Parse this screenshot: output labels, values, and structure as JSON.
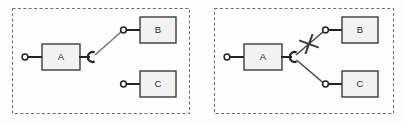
{
  "canvas": {
    "width": 404,
    "height": 124,
    "background": "#fdfdfd"
  },
  "palette": {
    "box_fill": "#f2f2f2",
    "box_stroke": "#3b3b3b",
    "panel_stroke": "#6b6b6b",
    "connector_stroke": "#242424",
    "link_stroke": "#777777",
    "cross_stroke": "#3a3a3a",
    "label_color": "#2b2b2b"
  },
  "diagram": {
    "type": "component-assembly-diagram",
    "notation": "UML ball-and-socket (lollipop) connectors",
    "panels": [
      {
        "id": "panel-left",
        "name": "left-panel",
        "border_style": "dashed",
        "rect": {
          "x": 12,
          "y": 8,
          "w": 178,
          "h": 106
        },
        "components": [
          {
            "id": "left-a",
            "label": "A",
            "rect": {
              "x": 42,
              "y": 44,
              "w": 38,
              "h": 26
            },
            "provided_interface": {
              "kind": "lollipop-ball",
              "side": "left",
              "stem": {
                "x1": 27,
                "y1": 57,
                "x2": 42,
                "y2": 57
              },
              "ball": {
                "cx": 25,
                "cy": 57,
                "r": 3
              }
            },
            "required_interface": {
              "kind": "socket-arc",
              "side": "right",
              "stem": {
                "x1": 80,
                "y1": 57,
                "x2": 90,
                "y2": 57
              },
              "arc": {
                "cx": 93,
                "cy": 57,
                "r": 5,
                "opening_deg": 40
              }
            }
          },
          {
            "id": "left-b",
            "label": "B",
            "rect": {
              "x": 140,
              "y": 17,
              "w": 36,
              "h": 26
            },
            "provided_interface": {
              "kind": "lollipop-ball",
              "side": "left",
              "stem": {
                "x1": 127,
                "y1": 30,
                "x2": 140,
                "y2": 30
              },
              "ball": {
                "cx": 124,
                "cy": 30,
                "r": 3
              }
            }
          },
          {
            "id": "left-c",
            "label": "C",
            "rect": {
              "x": 140,
              "y": 71,
              "w": 36,
              "h": 26
            },
            "provided_interface": {
              "kind": "lollipop-ball",
              "side": "left",
              "stem": {
                "x1": 127,
                "y1": 84,
                "x2": 140,
                "y2": 84
              },
              "ball": {
                "cx": 124,
                "cy": 84,
                "r": 3
              }
            }
          }
        ],
        "links": [
          {
            "id": "left-link-a-b",
            "from": "left-a",
            "to": "left-b",
            "state": "connected",
            "path": {
              "x1": 95,
              "y1": 55,
              "x2": 121,
              "y2": 31
            }
          }
        ],
        "cross_marks": []
      },
      {
        "id": "panel-right",
        "name": "right-panel",
        "border_style": "dashed",
        "rect": {
          "x": 214,
          "y": 8,
          "w": 180,
          "h": 106
        },
        "components": [
          {
            "id": "right-a",
            "label": "A",
            "rect": {
              "x": 244,
              "y": 44,
              "w": 38,
              "h": 26
            },
            "provided_interface": {
              "kind": "lollipop-ball",
              "side": "left",
              "stem": {
                "x1": 229,
                "y1": 57,
                "x2": 244,
                "y2": 57
              },
              "ball": {
                "cx": 227,
                "cy": 57,
                "r": 3
              }
            },
            "required_interface": {
              "kind": "socket-arc",
              "side": "right",
              "stem": {
                "x1": 282,
                "y1": 57,
                "x2": 292,
                "y2": 57
              },
              "arc": {
                "cx": 295,
                "cy": 57,
                "r": 5,
                "opening_deg": 40
              }
            }
          },
          {
            "id": "right-b",
            "label": "B",
            "rect": {
              "x": 342,
              "y": 17,
              "w": 36,
              "h": 26
            },
            "provided_interface": {
              "kind": "lollipop-ball",
              "side": "left",
              "stem": {
                "x1": 329,
                "y1": 30,
                "x2": 342,
                "y2": 30
              },
              "ball": {
                "cx": 326,
                "cy": 30,
                "r": 3
              }
            }
          },
          {
            "id": "right-c",
            "label": "C",
            "rect": {
              "x": 342,
              "y": 71,
              "w": 36,
              "h": 26
            },
            "provided_interface": {
              "kind": "lollipop-ball",
              "side": "left",
              "stem": {
                "x1": 329,
                "y1": 84,
                "x2": 342,
                "y2": 84
              },
              "ball": {
                "cx": 326,
                "cy": 84,
                "r": 3
              }
            }
          }
        ],
        "links": [
          {
            "id": "right-link-a-b",
            "from": "right-a",
            "to": "right-b",
            "state": "broken",
            "path": {
              "x1": 297,
              "y1": 55,
              "x2": 323,
              "y2": 31
            }
          },
          {
            "id": "right-link-a-c",
            "from": "right-a",
            "to": "right-c",
            "state": "connected",
            "path": {
              "x1": 297,
              "y1": 60,
              "x2": 323,
              "y2": 83
            }
          }
        ],
        "cross_marks": [
          {
            "id": "right-cross-a-b",
            "on_link": "right-link-a-b",
            "glyph": "x-cross",
            "center": {
              "cx": 309,
              "cy": 44
            },
            "arm": 11,
            "rotation_deg": 20
          }
        ]
      }
    ]
  }
}
